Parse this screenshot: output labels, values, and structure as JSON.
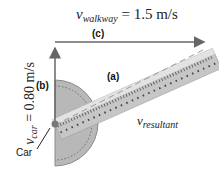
{
  "title": {
    "symbol": "v",
    "subscript": "walkway",
    "value": "= 1.5 m/s"
  },
  "vertical_label": {
    "symbol": "v",
    "subscript": "car",
    "value": "= 0.80 m/s"
  },
  "resultant_label": {
    "symbol": "v",
    "subscript": "resultant"
  },
  "tags": {
    "a": "(a)",
    "b": "(b)",
    "c": "(c)"
  },
  "car_label": "Car",
  "colors": {
    "arrow": "#666666",
    "protractor": "#b5b5b5",
    "ruler": "#c8c8c8",
    "dash": "#9a9a9a"
  }
}
